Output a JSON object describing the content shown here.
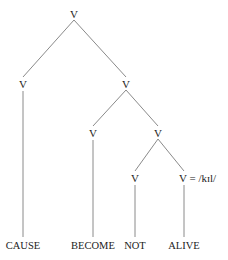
{
  "diagram": {
    "type": "syntax-tree",
    "line_color": "#8a8a8a",
    "text_color": "#222222",
    "nodes": [
      {
        "id": "root",
        "label": "V",
        "x": 74,
        "y": 14
      },
      {
        "id": "v_cause",
        "label": "V",
        "x": 23,
        "y": 84
      },
      {
        "id": "v_right",
        "label": "V",
        "x": 126,
        "y": 84
      },
      {
        "id": "v_become",
        "label": "V",
        "x": 93,
        "y": 133
      },
      {
        "id": "v_lower",
        "label": "V",
        "x": 158,
        "y": 133
      },
      {
        "id": "v_not",
        "label": "V",
        "x": 135,
        "y": 178
      },
      {
        "id": "v_alive",
        "label": "V = /kɪl/",
        "x": 184,
        "y": 178,
        "anchor": "left"
      }
    ],
    "leaves": [
      {
        "id": "leaf_cause",
        "label": "CAUSE",
        "x": 23,
        "y": 246
      },
      {
        "id": "leaf_become",
        "label": "BECOME",
        "x": 93,
        "y": 246
      },
      {
        "id": "leaf_not",
        "label": "NOT",
        "x": 135,
        "y": 246
      },
      {
        "id": "leaf_alive",
        "label": "ALIVE",
        "x": 184,
        "y": 246
      }
    ],
    "edges": [
      {
        "from": "root",
        "to": "v_cause",
        "x1": 74,
        "y1": 20,
        "x2": 23,
        "y2": 77
      },
      {
        "from": "root",
        "to": "v_right",
        "x1": 74,
        "y1": 20,
        "x2": 126,
        "y2": 77
      },
      {
        "from": "v_cause",
        "to": "leaf_cause",
        "x1": 23,
        "y1": 91,
        "x2": 23,
        "y2": 237
      },
      {
        "from": "v_right",
        "to": "v_become",
        "x1": 126,
        "y1": 90,
        "x2": 93,
        "y2": 126
      },
      {
        "from": "v_right",
        "to": "v_lower",
        "x1": 126,
        "y1": 90,
        "x2": 158,
        "y2": 126
      },
      {
        "from": "v_become",
        "to": "leaf_become",
        "x1": 93,
        "y1": 140,
        "x2": 93,
        "y2": 237
      },
      {
        "from": "v_lower",
        "to": "v_not",
        "x1": 158,
        "y1": 139,
        "x2": 135,
        "y2": 171
      },
      {
        "from": "v_lower",
        "to": "v_alive",
        "x1": 158,
        "y1": 139,
        "x2": 184,
        "y2": 171
      },
      {
        "from": "v_not",
        "to": "leaf_not",
        "x1": 135,
        "y1": 185,
        "x2": 135,
        "y2": 237
      },
      {
        "from": "v_alive",
        "to": "leaf_alive",
        "x1": 184,
        "y1": 185,
        "x2": 184,
        "y2": 237
      }
    ]
  }
}
